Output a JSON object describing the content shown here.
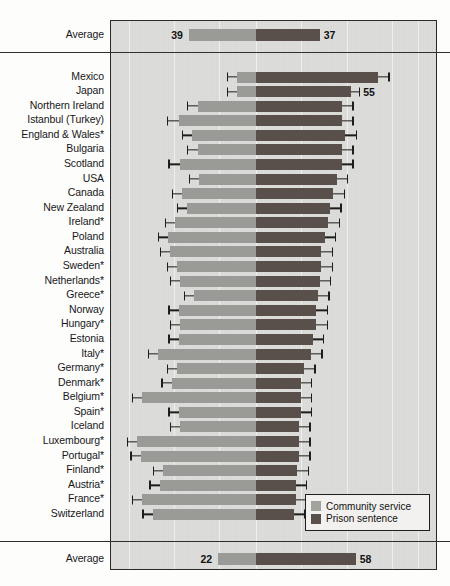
{
  "chart_data": {
    "type": "bar",
    "subtype": "diverging-horizontal-bar",
    "title": "",
    "xlabel": "",
    "ylabel": "",
    "grid": true,
    "legend_position": "bottom-right",
    "zero_axis_label": "",
    "series": [
      {
        "name": "Community service",
        "direction": "left",
        "color": "#9a9a96"
      },
      {
        "name": "Prison sentence",
        "direction": "right",
        "color": "#59504c"
      }
    ],
    "categories": [
      "Average",
      "Mexico",
      "Japan",
      "Northern Ireland",
      "Istanbul (Turkey)",
      "England & Wales*",
      "Bulgaria",
      "Scotland",
      "USA",
      "Canada",
      "New Zealand",
      "Ireland*",
      "Poland",
      "Australia",
      "Sweden*",
      "Netherlands*",
      "Greece*",
      "Norway",
      "Hungary*",
      "Estonia",
      "Italy*",
      "Germany*",
      "Denmark*",
      "Belgium*",
      "Spain*",
      "Iceland",
      "Luxembourg*",
      "Portugal*",
      "Finland*",
      "Austria*",
      "France*",
      "Switzerland",
      "Average"
    ],
    "rows": [
      {
        "label": "Average",
        "community_service": 39,
        "prison_sentence": 37,
        "show_values": true,
        "error_bars": false,
        "section": "top-average"
      },
      {
        "label": "Mexico",
        "community_service": 11,
        "prison_sentence": 71,
        "show_values": false,
        "error_bars": true,
        "ci_left": 6,
        "ci_right": 6,
        "section": "countries"
      },
      {
        "label": "Japan",
        "community_service": 11,
        "prison_sentence": 55,
        "show_values": true,
        "value_right": 55,
        "error_bars": true,
        "ci_left": 6,
        "ci_right": 5,
        "section": "countries"
      },
      {
        "label": "Northern Ireland",
        "community_service": 34,
        "prison_sentence": 50,
        "show_values": false,
        "error_bars": true,
        "ci_left": 6,
        "ci_right": 6,
        "section": "countries"
      },
      {
        "label": "Istanbul (Turkey)",
        "community_service": 45,
        "prison_sentence": 50,
        "show_values": false,
        "error_bars": true,
        "ci_left": 7,
        "ci_right": 6,
        "section": "countries"
      },
      {
        "label": "England & Wales*",
        "community_service": 37,
        "prison_sentence": 52,
        "show_values": false,
        "error_bars": true,
        "ci_left": 6,
        "ci_right": 6,
        "section": "countries"
      },
      {
        "label": "Bulgaria",
        "community_service": 34,
        "prison_sentence": 50,
        "show_values": false,
        "error_bars": true,
        "ci_left": 6,
        "ci_right": 6,
        "section": "countries"
      },
      {
        "label": "Scotland",
        "community_service": 44,
        "prison_sentence": 50,
        "show_values": false,
        "error_bars": true,
        "ci_left": 7,
        "ci_right": 6,
        "section": "countries"
      },
      {
        "label": "USA",
        "community_service": 33,
        "prison_sentence": 47,
        "show_values": false,
        "error_bars": true,
        "ci_left": 6,
        "ci_right": 6,
        "section": "countries"
      },
      {
        "label": "Canada",
        "community_service": 43,
        "prison_sentence": 45,
        "show_values": false,
        "error_bars": true,
        "ci_left": 6,
        "ci_right": 6,
        "section": "countries"
      },
      {
        "label": "New Zealand",
        "community_service": 40,
        "prison_sentence": 43,
        "show_values": false,
        "error_bars": true,
        "ci_left": 6,
        "ci_right": 6,
        "section": "countries"
      },
      {
        "label": "Ireland*",
        "community_service": 47,
        "prison_sentence": 42,
        "show_values": false,
        "error_bars": true,
        "ci_left": 6,
        "ci_right": 6,
        "section": "countries"
      },
      {
        "label": "Poland",
        "community_service": 51,
        "prison_sentence": 40,
        "show_values": false,
        "error_bars": true,
        "ci_left": 6,
        "ci_right": 6,
        "section": "countries"
      },
      {
        "label": "Australia",
        "community_service": 50,
        "prison_sentence": 38,
        "show_values": false,
        "error_bars": true,
        "ci_left": 6,
        "ci_right": 6,
        "section": "countries"
      },
      {
        "label": "Sweden*",
        "community_service": 46,
        "prison_sentence": 38,
        "show_values": false,
        "error_bars": true,
        "ci_left": 6,
        "ci_right": 6,
        "section": "countries"
      },
      {
        "label": "Netherlands*",
        "community_service": 44,
        "prison_sentence": 37,
        "show_values": false,
        "error_bars": true,
        "ci_left": 6,
        "ci_right": 6,
        "section": "countries"
      },
      {
        "label": "Greece*",
        "community_service": 36,
        "prison_sentence": 36,
        "show_values": false,
        "error_bars": true,
        "ci_left": 6,
        "ci_right": 6,
        "section": "countries"
      },
      {
        "label": "Norway",
        "community_service": 45,
        "prison_sentence": 35,
        "show_values": false,
        "error_bars": true,
        "ci_left": 6,
        "ci_right": 6,
        "section": "countries"
      },
      {
        "label": "Hungary*",
        "community_service": 44,
        "prison_sentence": 35,
        "show_values": false,
        "error_bars": true,
        "ci_left": 6,
        "ci_right": 6,
        "section": "countries"
      },
      {
        "label": "Estonia",
        "community_service": 45,
        "prison_sentence": 33,
        "show_values": false,
        "error_bars": true,
        "ci_left": 6,
        "ci_right": 6,
        "section": "countries"
      },
      {
        "label": "Italy*",
        "community_service": 57,
        "prison_sentence": 32,
        "show_values": false,
        "error_bars": true,
        "ci_left": 6,
        "ci_right": 6,
        "section": "countries"
      },
      {
        "label": "Germany*",
        "community_service": 46,
        "prison_sentence": 28,
        "show_values": false,
        "error_bars": true,
        "ci_left": 6,
        "ci_right": 6,
        "section": "countries"
      },
      {
        "label": "Denmark*",
        "community_service": 49,
        "prison_sentence": 26,
        "show_values": false,
        "error_bars": true,
        "ci_left": 6,
        "ci_right": 6,
        "section": "countries"
      },
      {
        "label": "Belgium*",
        "community_service": 66,
        "prison_sentence": 26,
        "show_values": false,
        "error_bars": true,
        "ci_left": 6,
        "ci_right": 6,
        "section": "countries"
      },
      {
        "label": "Spain*",
        "community_service": 45,
        "prison_sentence": 26,
        "show_values": false,
        "error_bars": true,
        "ci_left": 6,
        "ci_right": 6,
        "section": "countries"
      },
      {
        "label": "Iceland",
        "community_service": 44,
        "prison_sentence": 25,
        "show_values": false,
        "error_bars": true,
        "ci_left": 6,
        "ci_right": 6,
        "section": "countries"
      },
      {
        "label": "Luxembourg*",
        "community_service": 69,
        "prison_sentence": 25,
        "show_values": false,
        "error_bars": true,
        "ci_left": 6,
        "ci_right": 6,
        "section": "countries"
      },
      {
        "label": "Portugal*",
        "community_service": 67,
        "prison_sentence": 25,
        "show_values": false,
        "error_bars": true,
        "ci_left": 6,
        "ci_right": 6,
        "section": "countries"
      },
      {
        "label": "Finland*",
        "community_service": 54,
        "prison_sentence": 24,
        "show_values": false,
        "error_bars": true,
        "ci_left": 6,
        "ci_right": 6,
        "section": "countries"
      },
      {
        "label": "Austria*",
        "community_service": 56,
        "prison_sentence": 23,
        "show_values": false,
        "error_bars": true,
        "ci_left": 6,
        "ci_right": 6,
        "section": "countries"
      },
      {
        "label": "France*",
        "community_service": 66,
        "prison_sentence": 23,
        "show_values": false,
        "error_bars": true,
        "ci_left": 6,
        "ci_right": 6,
        "section": "countries"
      },
      {
        "label": "Switzerland",
        "community_service": 60,
        "prison_sentence": 22,
        "show_values": false,
        "error_bars": true,
        "ci_left": 6,
        "ci_right": 6,
        "section": "countries"
      },
      {
        "label": "Average",
        "community_service": 22,
        "prison_sentence": 58,
        "show_values": true,
        "error_bars": false,
        "section": "bottom-average"
      }
    ]
  },
  "legend": {
    "items": [
      {
        "label": "Community service",
        "color": "#a3a39e"
      },
      {
        "label": "Prison sentence",
        "color": "#59504c"
      }
    ]
  }
}
